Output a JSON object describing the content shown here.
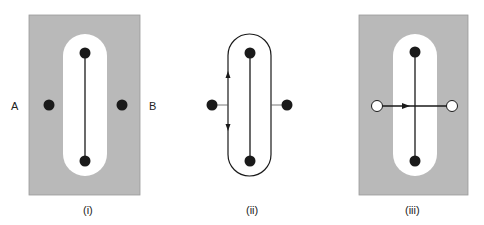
{
  "colors": {
    "shaded": "#b9b9b9",
    "background": "#ffffff",
    "ink": "#1a1a1a"
  },
  "panels": [
    {
      "caption": "(i)",
      "left_label": "A",
      "right_label": "B",
      "description": "Shaded rectangle with white pill-shaped cut-out; line between two charges inside pill; two charges outside on either side"
    },
    {
      "caption": "(ii)",
      "description": "Pill-shaped closed contour around a line joining two charges; arrows along left side pointing up and down; outside charges connected by short lines"
    },
    {
      "caption": "(iii)",
      "description": "Shaded rectangle with white pill cut-out; vertical line between two charges crossed by horizontal arrow between two open circles"
    }
  ]
}
